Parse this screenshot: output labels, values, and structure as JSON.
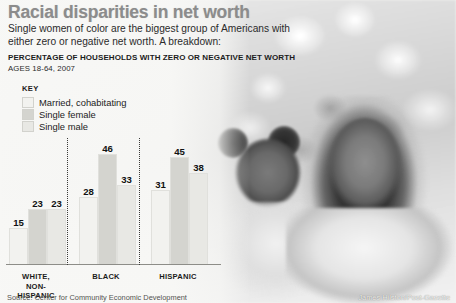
{
  "headline": "Racial disparities in net worth",
  "deck": "Single women of color are the biggest group of Americans with either zero or negative net worth. A breakdown:",
  "subhead": "PERCENTAGE OF HOUSEHOLDS WITH ZERO OR NEGATIVE NET WORTH",
  "ages": "AGES 18-64, 2007",
  "key": {
    "title": "KEY",
    "items": [
      {
        "label": "Married, cohabitating",
        "color": "#f2f2ef"
      },
      {
        "label": "Single female",
        "color": "#d4d4cf"
      },
      {
        "label": "Single male",
        "color": "#e8e8e4"
      }
    ]
  },
  "footer": {
    "source": "Source: Center for Community Economic Development",
    "credit": "James Hilston/Post-Gazette"
  },
  "chart_data": {
    "type": "bar",
    "title": "PERCENTAGE OF HOUSEHOLDS WITH ZERO OR NEGATIVE NET WORTH",
    "subtitle": "AGES 18-64, 2007",
    "xlabel": "",
    "ylabel": "Percentage of households",
    "ylim": [
      0,
      50
    ],
    "grid": false,
    "legend_position": "top-left",
    "categories": [
      "WHITE, NON-HISPANIC",
      "BLACK",
      "HISPANIC"
    ],
    "series": [
      {
        "name": "Married, cohabitating",
        "color": "#f2f2ef",
        "values": [
          15,
          28,
          31
        ]
      },
      {
        "name": "Single female",
        "color": "#d4d4cf",
        "values": [
          23,
          46,
          45
        ]
      },
      {
        "name": "Single male",
        "color": "#e8e8e4",
        "values": [
          23,
          33,
          38
        ]
      }
    ],
    "groups": [
      {
        "label_line1": "WHITE,",
        "label_line2": "NON-HISPANIC",
        "bars": [
          {
            "series": "Married, cohabitating",
            "value": 15
          },
          {
            "series": "Single female",
            "value": 23
          },
          {
            "series": "Single male",
            "value": 23
          }
        ]
      },
      {
        "label_line1": "BLACK",
        "label_line2": "",
        "bars": [
          {
            "series": "Married, cohabitating",
            "value": 28
          },
          {
            "series": "Single female",
            "value": 46
          },
          {
            "series": "Single male",
            "value": 33
          }
        ]
      },
      {
        "label_line1": "HISPANIC",
        "label_line2": "",
        "bars": [
          {
            "series": "Married, cohabitating",
            "value": 31
          },
          {
            "series": "Single female",
            "value": 45
          },
          {
            "series": "Single male",
            "value": 38
          }
        ]
      }
    ]
  }
}
